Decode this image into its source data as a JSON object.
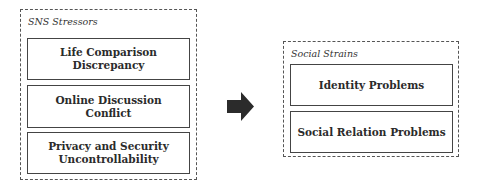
{
  "diagram": {
    "left_group": {
      "title": "SNS Stressors",
      "items": [
        {
          "label": "Life Comparison Discrepancy"
        },
        {
          "label": "Online Discussion Conflict"
        },
        {
          "label": "Privacy and Security Uncontrollability"
        }
      ]
    },
    "arrow": {
      "direction": "right",
      "color": "#2b2b2b"
    },
    "right_group": {
      "title": "Social Strains",
      "items": [
        {
          "label": "Identity Problems"
        },
        {
          "label": "Social Relation Problems"
        }
      ]
    }
  }
}
